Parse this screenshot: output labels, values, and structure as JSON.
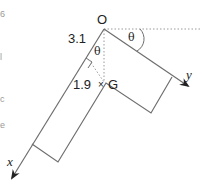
{
  "diagram": {
    "type": "mechanics-free-body",
    "labels": {
      "origin": "O",
      "length_OG_along_x": "3.1",
      "length_perp": "1.9",
      "centre_of_mass": "G",
      "angle_at_O_inner": "θ",
      "angle_with_horizontal": "θ",
      "axis_x": "x",
      "axis_y": "y",
      "centre_marker": "×"
    },
    "colors": {
      "line": "#6e6e6e",
      "dotted": "#9a9a9a",
      "arrow": "#222222",
      "text": "#222222"
    },
    "left_edge_fragments": [
      "6",
      "l",
      "c",
      "e"
    ]
  }
}
